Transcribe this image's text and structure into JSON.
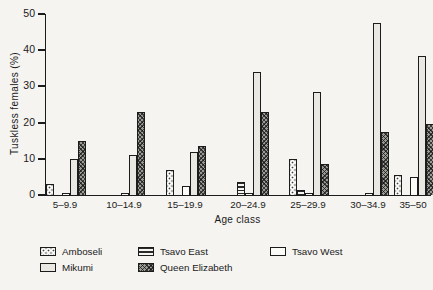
{
  "chart_data": {
    "type": "bar",
    "title": "",
    "ylabel": "Tuskless females (%)",
    "xlabel": "Age class",
    "ylim": [
      0,
      50
    ],
    "yticks": [
      0,
      10,
      20,
      30,
      40,
      50
    ],
    "grid": false,
    "legend_position": "bottom",
    "categories": [
      "5–9.9",
      "10–14.9",
      "15–19.9",
      "20–24.9",
      "25–29.9",
      "30–34.9",
      "35–50"
    ],
    "series": [
      {
        "name": "Amboseli",
        "pattern": "dots",
        "values": [
          3,
          0,
          7,
          0,
          10,
          0,
          5.5
        ]
      },
      {
        "name": "Tsavo East",
        "pattern": "hstripes",
        "values": [
          0,
          0,
          0,
          3.5,
          1.5,
          0,
          0
        ]
      },
      {
        "name": "Tsavo West",
        "pattern": "white",
        "values": [
          0.5,
          0.5,
          2.5,
          0.5,
          0.5,
          0.5,
          5
        ]
      },
      {
        "name": "Mikumi",
        "pattern": "gray",
        "values": [
          10,
          11,
          12,
          34,
          28.5,
          47.5,
          38.5
        ]
      },
      {
        "name": "Queen Elizabeth",
        "pattern": "crosshatch",
        "values": [
          15,
          23,
          13.5,
          23,
          8.5,
          17.5,
          19.5
        ]
      }
    ],
    "legend_rows": [
      [
        "Amboseli",
        "Tsavo East",
        "Tsavo West"
      ],
      [
        "Mikumi",
        "Queen Elizabeth"
      ]
    ]
  },
  "colors": {
    "axis": "#1c1c1c",
    "paper": "#f5f4f1",
    "mikumi_fill": "#e9e8e2",
    "queen_elizabeth_fill": "#9b9b96"
  }
}
